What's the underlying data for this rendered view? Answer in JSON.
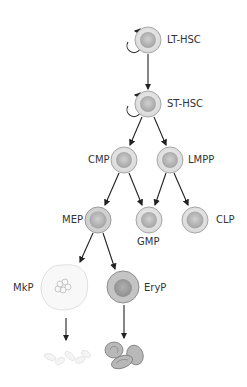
{
  "diagram": {
    "type": "hematopoietic-lineage-tree",
    "nodes": [
      {
        "id": "lt_hsc",
        "label": "LT-HSC",
        "self_renewal": true
      },
      {
        "id": "st_hsc",
        "label": "ST-HSC",
        "self_renewal": true
      },
      {
        "id": "cmp",
        "label": "CMP"
      },
      {
        "id": "lmpp",
        "label": "LMPP"
      },
      {
        "id": "mep",
        "label": "MEP"
      },
      {
        "id": "gmp",
        "label": "GMP"
      },
      {
        "id": "clp",
        "label": "CLP"
      },
      {
        "id": "mkp",
        "label": "MkP"
      },
      {
        "id": "eryp",
        "label": "EryP"
      },
      {
        "id": "platelets",
        "label": ""
      },
      {
        "id": "erythrocytes",
        "label": ""
      }
    ],
    "edges": [
      [
        "LT-HSC",
        "ST-HSC"
      ],
      [
        "ST-HSC",
        "CMP"
      ],
      [
        "ST-HSC",
        "LMPP"
      ],
      [
        "CMP",
        "MEP"
      ],
      [
        "CMP",
        "GMP"
      ],
      [
        "LMPP",
        "GMP"
      ],
      [
        "LMPP",
        "CLP"
      ],
      [
        "MEP",
        "MkP"
      ],
      [
        "MEP",
        "EryP"
      ],
      [
        "MkP",
        "platelets"
      ],
      [
        "EryP",
        "erythrocytes"
      ]
    ]
  },
  "labels": {
    "lt_hsc": "LT-HSC",
    "st_hsc": "ST-HSC",
    "cmp": "CMP",
    "lmpp": "LMPP",
    "mep": "MEP",
    "gmp": "GMP",
    "clp": "CLP",
    "mkp": "MkP",
    "eryp": "EryP"
  },
  "colors": {
    "cell_outer": "#dcdcdc",
    "cell_border": "#a8a8a8",
    "nucleus": "#b4b4b4",
    "arrow": "#222222",
    "text": "#333333"
  }
}
